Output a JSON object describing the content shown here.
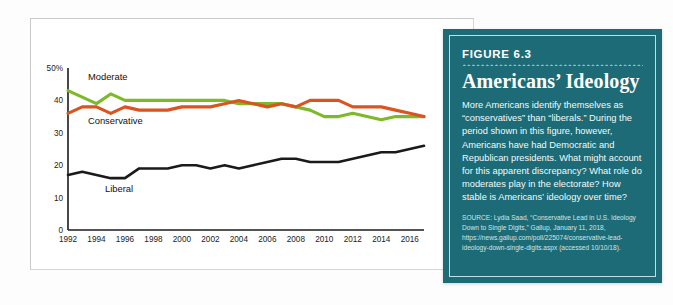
{
  "chart_data": {
    "type": "line",
    "title": "",
    "xlabel": "",
    "ylabel": "",
    "xlim": [
      1992,
      2017
    ],
    "ylim": [
      0,
      50
    ],
    "yticks": [
      0,
      10,
      20,
      30,
      40,
      50
    ],
    "ytick_labels": [
      "0",
      "10",
      "20",
      "30",
      "40",
      "50%"
    ],
    "xticks": [
      1992,
      1994,
      1996,
      1998,
      2000,
      2002,
      2004,
      2006,
      2008,
      2010,
      2012,
      2014,
      2016
    ],
    "xtick_labels": [
      "1992",
      "1994",
      "1996",
      "1998",
      "2000",
      "2002",
      "2004",
      "2006",
      "2008",
      "2010",
      "2012",
      "2014",
      "2016"
    ],
    "grid": false,
    "legend_position": "inline-labels",
    "x": [
      1992,
      1993,
      1994,
      1995,
      1996,
      1997,
      1998,
      1999,
      2000,
      2001,
      2002,
      2003,
      2004,
      2005,
      2006,
      2007,
      2008,
      2009,
      2010,
      2011,
      2012,
      2013,
      2014,
      2015,
      2016,
      2017
    ],
    "series": [
      {
        "name": "Moderate",
        "color": "#7db928",
        "values": [
          43,
          41,
          39,
          42,
          40,
          40,
          40,
          40,
          40,
          40,
          40,
          40,
          39,
          39,
          39,
          39,
          38,
          37,
          35,
          35,
          36,
          35,
          34,
          35,
          35,
          35
        ]
      },
      {
        "name": "Conservative",
        "color": "#d9541e",
        "values": [
          36,
          38,
          38,
          36,
          38,
          37,
          37,
          37,
          38,
          38,
          38,
          39,
          40,
          39,
          38,
          39,
          38,
          40,
          40,
          40,
          38,
          38,
          38,
          37,
          36,
          35
        ]
      },
      {
        "name": "Liberal",
        "color": "#1a1a1a",
        "values": [
          17,
          18,
          17,
          16,
          16,
          19,
          19,
          19,
          20,
          20,
          19,
          20,
          19,
          20,
          21,
          22,
          22,
          21,
          21,
          21,
          22,
          23,
          24,
          24,
          25,
          26
        ]
      }
    ],
    "series_label_positions": [
      {
        "name": "Moderate",
        "x": 1993.4,
        "y": 46.2
      },
      {
        "name": "Conservative",
        "x": 1993.4,
        "y": 32.6
      },
      {
        "name": "Liberal",
        "x": 1994.6,
        "y": 11.6
      }
    ],
    "colors": {
      "moderate": "#7db928",
      "conservative": "#d9541e",
      "liberal": "#1a1a1a",
      "axis": "#1b1b1b"
    }
  },
  "figure_panel": {
    "figure_number": "FIGURE 6.3",
    "title": "Americans’ Ideology",
    "body": "More Americans identify themselves as “conservatives” than “liberals.” During the period shown in this figure, however, Americans have had Democratic and Republican presidents. What might account for this apparent discrepancy? What role do moderates play in the electorate? How stable is Americans’ ideology over time?",
    "source": "SOURCE: Lydia Saad, “Conservative Lead in U.S. Ideology Down to Single Digits,” Gallup, January 11, 2018, https://news.gallup.com/poll/225074/conservative-lead-ideology-down-single-digits.aspx (accessed 10/10/18).",
    "panel_color": "#1d6b76",
    "inner_border_color": "#bfe0e2"
  }
}
